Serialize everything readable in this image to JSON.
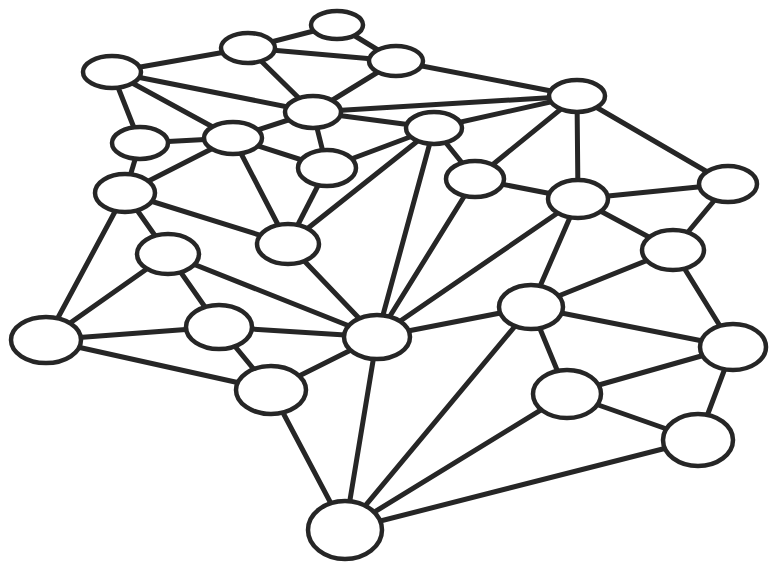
{
  "diagram": {
    "type": "network-graph",
    "style": {
      "stroke_color": "#262626",
      "node_fill": "#ffffff",
      "background": "#ffffff"
    },
    "nodes": [
      {
        "id": "A",
        "x": 337,
        "y": 25,
        "rx": 26,
        "ry": 14
      },
      {
        "id": "B",
        "x": 248,
        "y": 48,
        "rx": 27,
        "ry": 15
      },
      {
        "id": "C",
        "x": 112,
        "y": 72,
        "rx": 29,
        "ry": 16
      },
      {
        "id": "D",
        "x": 396,
        "y": 61,
        "rx": 27,
        "ry": 15
      },
      {
        "id": "E",
        "x": 313,
        "y": 112,
        "rx": 28,
        "ry": 16
      },
      {
        "id": "F",
        "x": 233,
        "y": 138,
        "rx": 29,
        "ry": 16
      },
      {
        "id": "G",
        "x": 140,
        "y": 143,
        "rx": 28,
        "ry": 16
      },
      {
        "id": "H",
        "x": 327,
        "y": 168,
        "rx": 29,
        "ry": 18
      },
      {
        "id": "I",
        "x": 125,
        "y": 193,
        "rx": 30,
        "ry": 19
      },
      {
        "id": "J",
        "x": 288,
        "y": 244,
        "rx": 31,
        "ry": 20
      },
      {
        "id": "K",
        "x": 168,
        "y": 254,
        "rx": 31,
        "ry": 20
      },
      {
        "id": "L",
        "x": 577,
        "y": 96,
        "rx": 28,
        "ry": 16
      },
      {
        "id": "M",
        "x": 434,
        "y": 128,
        "rx": 28,
        "ry": 16
      },
      {
        "id": "N",
        "x": 475,
        "y": 179,
        "rx": 29,
        "ry": 18
      },
      {
        "id": "O",
        "x": 578,
        "y": 199,
        "rx": 30,
        "ry": 19
      },
      {
        "id": "P",
        "x": 728,
        "y": 184,
        "rx": 29,
        "ry": 18
      },
      {
        "id": "Q",
        "x": 673,
        "y": 250,
        "rx": 31,
        "ry": 20
      },
      {
        "id": "R",
        "x": 46,
        "y": 340,
        "rx": 35,
        "ry": 23
      },
      {
        "id": "S",
        "x": 219,
        "y": 327,
        "rx": 33,
        "ry": 22
      },
      {
        "id": "T",
        "x": 271,
        "y": 390,
        "rx": 35,
        "ry": 24
      },
      {
        "id": "U",
        "x": 377,
        "y": 337,
        "rx": 33,
        "ry": 22
      },
      {
        "id": "V",
        "x": 345,
        "y": 530,
        "rx": 37,
        "ry": 29
      },
      {
        "id": "W",
        "x": 531,
        "y": 307,
        "rx": 32,
        "ry": 22
      },
      {
        "id": "X",
        "x": 733,
        "y": 347,
        "rx": 33,
        "ry": 23
      },
      {
        "id": "Y",
        "x": 567,
        "y": 394,
        "rx": 34,
        "ry": 24
      },
      {
        "id": "Z",
        "x": 698,
        "y": 440,
        "rx": 35,
        "ry": 26
      }
    ],
    "edges": [
      [
        "A",
        "B"
      ],
      [
        "A",
        "D"
      ],
      [
        "B",
        "D"
      ],
      [
        "B",
        "E"
      ],
      [
        "B",
        "C"
      ],
      [
        "D",
        "E"
      ],
      [
        "D",
        "L"
      ],
      [
        "C",
        "E"
      ],
      [
        "C",
        "F"
      ],
      [
        "C",
        "G"
      ],
      [
        "E",
        "L"
      ],
      [
        "E",
        "M"
      ],
      [
        "E",
        "F"
      ],
      [
        "E",
        "H"
      ],
      [
        "F",
        "G"
      ],
      [
        "F",
        "H"
      ],
      [
        "F",
        "I"
      ],
      [
        "F",
        "J"
      ],
      [
        "G",
        "I"
      ],
      [
        "H",
        "M"
      ],
      [
        "H",
        "J"
      ],
      [
        "I",
        "K"
      ],
      [
        "I",
        "R"
      ],
      [
        "I",
        "J"
      ],
      [
        "J",
        "M"
      ],
      [
        "J",
        "U"
      ],
      [
        "K",
        "R"
      ],
      [
        "K",
        "S"
      ],
      [
        "K",
        "U"
      ],
      [
        "R",
        "S"
      ],
      [
        "R",
        "T"
      ],
      [
        "S",
        "T"
      ],
      [
        "S",
        "U"
      ],
      [
        "T",
        "U"
      ],
      [
        "T",
        "V"
      ],
      [
        "M",
        "L"
      ],
      [
        "M",
        "N"
      ],
      [
        "M",
        "U"
      ],
      [
        "N",
        "L"
      ],
      [
        "N",
        "O"
      ],
      [
        "N",
        "U"
      ],
      [
        "L",
        "O"
      ],
      [
        "L",
        "P"
      ],
      [
        "O",
        "P"
      ],
      [
        "O",
        "Q"
      ],
      [
        "O",
        "U"
      ],
      [
        "O",
        "W"
      ],
      [
        "P",
        "Q"
      ],
      [
        "Q",
        "W"
      ],
      [
        "Q",
        "X"
      ],
      [
        "U",
        "V"
      ],
      [
        "U",
        "W"
      ],
      [
        "W",
        "X"
      ],
      [
        "W",
        "Y"
      ],
      [
        "W",
        "V"
      ],
      [
        "X",
        "Y"
      ],
      [
        "X",
        "Z"
      ],
      [
        "Y",
        "Z"
      ],
      [
        "Y",
        "V"
      ],
      [
        "Z",
        "V"
      ]
    ]
  }
}
